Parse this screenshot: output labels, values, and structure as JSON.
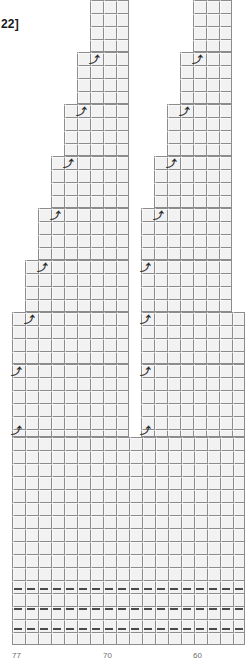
{
  "chart_data": {
    "type": "heatmap",
    "title": "",
    "subtitle": "",
    "xlabel": "",
    "ylabel": "",
    "grid": true,
    "legend_position": "none",
    "cell_size_px": 13,
    "x_axis": {
      "ticks": [
        {
          "label": "77",
          "x": 12
        },
        {
          "label": "70",
          "x": 103
        },
        {
          "label": "60",
          "x": 193
        }
      ],
      "range_labels": [
        "77",
        "70",
        "60"
      ]
    },
    "top_label": "22]",
    "symbol": "⤴",
    "symbol_name": "left-leaning-decrease",
    "note": "",
    "blocks": [
      {
        "id": "L-step-1",
        "x": 90,
        "y": 0,
        "w": 39,
        "h": 52
      },
      {
        "id": "L-step-2",
        "x": 77,
        "y": 52,
        "w": 52,
        "h": 52
      },
      {
        "id": "L-step-3",
        "x": 64,
        "y": 104,
        "w": 65,
        "h": 52
      },
      {
        "id": "L-step-4",
        "x": 51,
        "y": 156,
        "w": 78,
        "h": 52
      },
      {
        "id": "L-step-5",
        "x": 38,
        "y": 208,
        "w": 91,
        "h": 52
      },
      {
        "id": "L-step-6",
        "x": 25,
        "y": 260,
        "w": 104,
        "h": 52
      },
      {
        "id": "L-step-7",
        "x": 12,
        "y": 312,
        "w": 117,
        "h": 52
      },
      {
        "id": "L-step-8",
        "x": 12,
        "y": 364,
        "w": 117,
        "h": 73
      },
      {
        "id": "R-step-1",
        "x": 193,
        "y": 0,
        "w": 39,
        "h": 52
      },
      {
        "id": "R-step-2",
        "x": 180,
        "y": 52,
        "w": 52,
        "h": 52
      },
      {
        "id": "R-step-3",
        "x": 167,
        "y": 104,
        "w": 65,
        "h": 52
      },
      {
        "id": "R-step-4",
        "x": 154,
        "y": 156,
        "w": 78,
        "h": 52
      },
      {
        "id": "R-step-5",
        "x": 141,
        "y": 208,
        "w": 91,
        "h": 52
      },
      {
        "id": "R-step-6",
        "x": 141,
        "y": 260,
        "w": 91,
        "h": 52
      },
      {
        "id": "R-step-7",
        "x": 141,
        "y": 312,
        "w": 104,
        "h": 52
      },
      {
        "id": "R-step-8",
        "x": 141,
        "y": 364,
        "w": 104,
        "h": 73
      },
      {
        "id": "base-full",
        "x": 12,
        "y": 437,
        "w": 233,
        "h": 208
      }
    ],
    "symbols": [
      {
        "id": "sym-L1",
        "x": 88,
        "y": 53
      },
      {
        "id": "sym-L2",
        "x": 75,
        "y": 105
      },
      {
        "id": "sym-L3",
        "x": 62,
        "y": 157
      },
      {
        "id": "sym-L4",
        "x": 49,
        "y": 209
      },
      {
        "id": "sym-L5",
        "x": 36,
        "y": 261
      },
      {
        "id": "sym-L6",
        "x": 23,
        "y": 313
      },
      {
        "id": "sym-L7",
        "x": 10,
        "y": 365
      },
      {
        "id": "sym-L8",
        "x": 10,
        "y": 424
      },
      {
        "id": "sym-R1",
        "x": 191,
        "y": 53
      },
      {
        "id": "sym-R2",
        "x": 178,
        "y": 105
      },
      {
        "id": "sym-R3",
        "x": 165,
        "y": 157
      },
      {
        "id": "sym-R4",
        "x": 152,
        "y": 209
      },
      {
        "id": "sym-R5",
        "x": 139,
        "y": 261
      },
      {
        "id": "sym-R6",
        "x": 139,
        "y": 313
      },
      {
        "id": "sym-R7",
        "x": 139,
        "y": 365
      },
      {
        "id": "sym-R8",
        "x": 139,
        "y": 424
      }
    ],
    "dash_rows": [
      {
        "id": "dash-row-1",
        "y": 583,
        "start_x": 14,
        "count": 18,
        "step": 13
      },
      {
        "id": "dash-row-2",
        "y": 603,
        "start_x": 14,
        "count": 18,
        "step": 13
      },
      {
        "id": "dash-row-3",
        "y": 623,
        "start_x": 14,
        "count": 18,
        "step": 13
      }
    ],
    "colors": {
      "cell_fill": "#f2f2f2",
      "grid_line": "#8c8c8c",
      "symbol": "#2b2b2b",
      "dash": "#4a4a4a",
      "axis_label": "#6e6e6e",
      "top_label": "#1a1a1a",
      "background": "#ffffff"
    }
  }
}
